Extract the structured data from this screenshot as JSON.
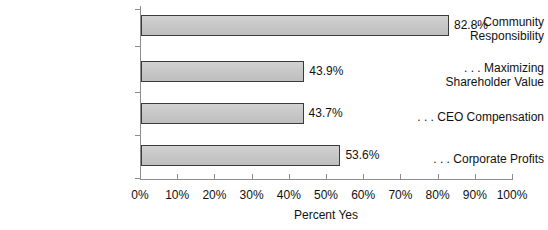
{
  "chart_data": {
    "type": "bar",
    "orientation": "horizontal",
    "title": "",
    "categories": [
      "... Community Responsibility",
      "... Maximizing Shareholder Value",
      "... CEO Compensation",
      "... Corporate Profits"
    ],
    "category_lines": [
      [
        ". . . Community",
        "Responsibility"
      ],
      [
        ". . . Maximizing",
        "Shareholder Value"
      ],
      [
        ". . . CEO Compensation"
      ],
      [
        ". . . Corporate Profits"
      ]
    ],
    "values": [
      82.8,
      43.9,
      43.7,
      53.6
    ],
    "value_labels": [
      "82.8%",
      "43.9%",
      "43.7%",
      "53.6%"
    ],
    "xlabel": "Percent  Yes",
    "ylabel": "",
    "xlim": [
      0,
      100
    ],
    "xticks": [
      0,
      10,
      20,
      30,
      40,
      50,
      60,
      70,
      80,
      90,
      100
    ],
    "xtick_labels": [
      "0%",
      "10%",
      "20%",
      "30%",
      "40%",
      "50%",
      "60%",
      "70%",
      "80%",
      "90%",
      "100%"
    ],
    "grid": false,
    "legend": false,
    "bar_color": "#c9c9c9",
    "bar_edge_color": "#3b3b3b",
    "axis_color": "#8d8d8d",
    "text_color": "#111111"
  }
}
